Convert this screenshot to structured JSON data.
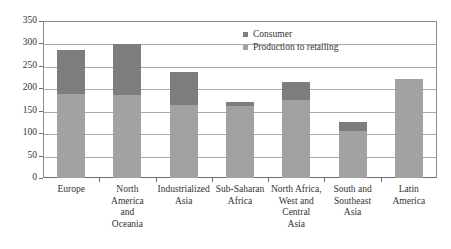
{
  "chart_data": {
    "type": "bar",
    "stacked": true,
    "title": "",
    "subtitle": "",
    "xlabel": "",
    "ylabel": "",
    "ylim": [
      0,
      350
    ],
    "yticks": [
      0,
      50,
      100,
      150,
      200,
      250,
      300,
      350
    ],
    "ytick_labels": [
      "0",
      "50",
      "100",
      "150",
      "200",
      "250",
      "300",
      "350"
    ],
    "grid": true,
    "legend_position": "top-right",
    "categories": [
      "Europe",
      "North America and Oceania",
      "Industrialized Asia",
      "Sub-Saharan Africa",
      "North Africa, West and Central Asia",
      "South and Southeast Asia",
      "Latin America"
    ],
    "category_label_lines": [
      [
        "Europe"
      ],
      [
        "North",
        "America",
        "and",
        "Oceania"
      ],
      [
        "Industrialized",
        "Asia"
      ],
      [
        "Sub-Saharan",
        "Africa"
      ],
      [
        "North Africa,",
        "West and",
        "Central",
        "Asia"
      ],
      [
        "South and",
        "Southeast",
        "Asia"
      ],
      [
        "Latin",
        "America"
      ]
    ],
    "series": [
      {
        "name": "Production to retailing",
        "color": "#a2a2a2",
        "values": [
          187,
          185,
          163,
          160,
          174,
          105,
          221
        ]
      },
      {
        "name": "Consumer",
        "color": "#7d7d7d",
        "values": [
          98,
          113,
          73,
          9,
          40,
          20,
          0
        ]
      }
    ],
    "totals": [
      285,
      298,
      236,
      169,
      214,
      125,
      221
    ]
  },
  "legend": {
    "items": [
      {
        "label": "Consumer",
        "color": "#7d7d7d"
      },
      {
        "label": "Production to retailing",
        "color": "#a2a2a2"
      }
    ]
  },
  "colors": {
    "consumer": "#7d7d7d",
    "production": "#a2a2a2",
    "gridline": "#a8a8a8",
    "axis": "#6e6e6e",
    "text": "#333333",
    "background": "#ffffff"
  }
}
